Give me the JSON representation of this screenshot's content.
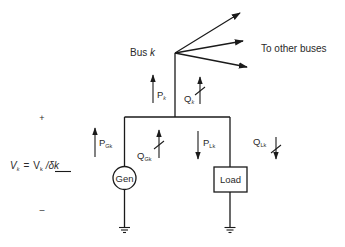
{
  "diagram": {
    "labels": {
      "bus": "Bus",
      "bus_var": "k",
      "to_other_buses": "To other buses",
      "P_k": "P",
      "P_k_sub": "k",
      "Q_k": "Q",
      "Q_k_sub": "k",
      "P_Gk": "P",
      "P_Gk_sub": "Gk",
      "Q_Gk": "Q",
      "Q_Gk_sub": "Gk",
      "P_Lk": "P",
      "P_Lk_sub": "Lk",
      "Q_Lk": "Q",
      "Q_Lk_sub": "Lk",
      "gen": "Gen",
      "load": "Load",
      "plus": "+",
      "minus": "–",
      "voltage_lhs": "V",
      "voltage_lhs_sub": "k",
      "equals": "=",
      "voltage_mag": "V",
      "voltage_mag_sub": "k",
      "voltage_angle": "/δk"
    },
    "nodes": [
      {
        "id": "bus-k",
        "type": "bus"
      },
      {
        "id": "gen",
        "type": "generator"
      },
      {
        "id": "load",
        "type": "load"
      },
      {
        "id": "ground-gen",
        "type": "ground"
      },
      {
        "id": "ground-load",
        "type": "ground"
      }
    ],
    "edges": [
      {
        "from": "bus-k",
        "to": "other-bus-1",
        "type": "arrow"
      },
      {
        "from": "bus-k",
        "to": "other-bus-2",
        "type": "arrow"
      },
      {
        "from": "bus-k",
        "to": "other-bus-3",
        "type": "arrow"
      },
      {
        "from": "gen",
        "to": "bus-k",
        "label": "P_Gk / Q_Gk"
      },
      {
        "from": "bus-k",
        "to": "load",
        "label": "P_Lk / Q_Lk"
      }
    ]
  }
}
